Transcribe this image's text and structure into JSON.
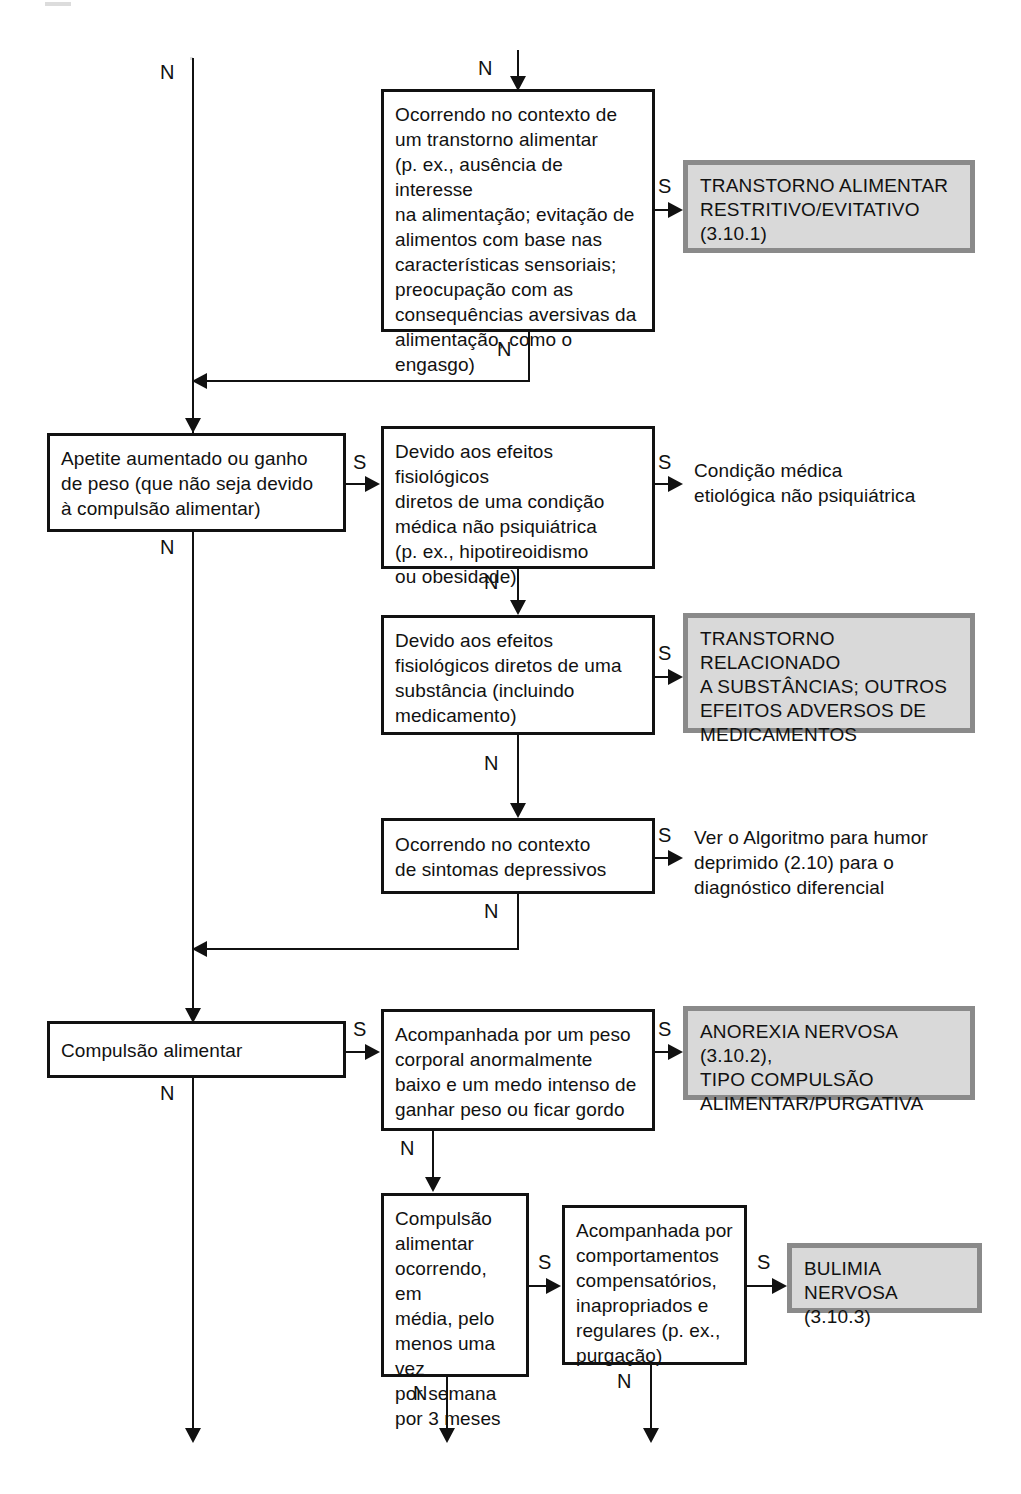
{
  "diagram": {
    "branch_yes": "S",
    "branch_no": "N",
    "colors": {
      "line": "#111111",
      "box_border": "#111111",
      "outcome_fill": "#d9d9d9",
      "outcome_border": "#8a8a8a",
      "background": "#ffffff"
    }
  },
  "nodes": {
    "q_eating_disorder_context": {
      "text": "Ocorrendo no contexto de\num transtorno alimentar\n(p. ex., ausência de interesse\nna alimentação; evitação de\nalimentos com base nas\ncaracterísticas sensoriais;\npreocupação com as\nconsequências aversivas da\nalimentação, como o engasgo)"
    },
    "out_arfid": {
      "text": "TRANSTORNO ALIMENTAR\nRESTRITIVO/EVITATIVO\n(3.10.1)"
    },
    "q_increased_appetite": {
      "text": "Apetite aumentado ou ganho\nde peso (que não seja devido\nà compulsão alimentar)"
    },
    "q_medical_condition": {
      "text": "Devido aos efeitos fisiológicos\ndiretos de uma condição\nmédica não psiquiátrica\n(p. ex., hipotireoidismo\nou obesidade)"
    },
    "out_medical_condition": {
      "text": "Condição médica\netiológica não psiquiátrica"
    },
    "q_substance": {
      "text": "Devido aos efeitos\nfisiológicos diretos de uma\nsubstância (incluindo\nmedicamento)"
    },
    "out_substance": {
      "text": "TRANSTORNO RELACIONADO\nA SUBSTÂNCIAS; OUTROS\nEFEITOS ADVERSOS DE\nMEDICAMENTOS"
    },
    "q_depressive": {
      "text": "Ocorrendo no contexto\nde sintomas depressivos"
    },
    "out_depressive": {
      "text": "Ver o Algoritmo para humor\ndeprimido (2.10) para o\ndiagnóstico diferencial"
    },
    "q_binge_eating": {
      "text": "Compulsão alimentar"
    },
    "q_low_weight_fear": {
      "text": "Acompanhada por um peso\ncorporal anormalmente\nbaixo e um medo intenso de\nganhar peso ou ficar gordo"
    },
    "out_anorexia": {
      "text": "ANOREXIA NERVOSA (3.10.2),\nTIPO COMPULSÃO\nALIMENTAR/PURGATIVA"
    },
    "q_binge_frequency": {
      "text": "Compulsão\nalimentar\nocorrendo, em\nmédia, pelo\nmenos uma vez\npor semana\npor 3 meses"
    },
    "q_compensatory": {
      "text": "Acompanhada por\ncomportamentos\ncompensatórios,\ninapropriados e\nregulares (p. ex.,\npurgação)"
    },
    "out_bulimia": {
      "text": "BULIMIA\nNERVOSA (3.10.3)"
    }
  },
  "labels": {
    "n_top_left": "N",
    "n_top_entry": "N",
    "s_arfid": "S",
    "n_arfid": "N",
    "s_medical": "S",
    "s_medical_out": "S",
    "n_appetite": "N",
    "n_medical": "N",
    "s_substance": "S",
    "n_substance": "N",
    "s_depressive": "S",
    "n_depressive": "N",
    "s_binge": "S",
    "n_binge": "N",
    "s_anorexia": "S",
    "n_lowweight": "N",
    "s_frequency": "S",
    "n_frequency": "N",
    "s_compensatory": "S",
    "n_compensatory": "N"
  }
}
